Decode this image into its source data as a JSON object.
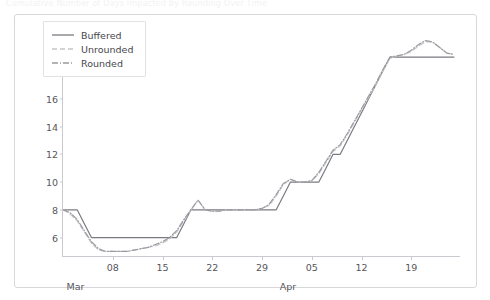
{
  "caption": "Cumulative Number of Days Impacted by Rounding Over Time",
  "legend": {
    "position": "top-left",
    "items": [
      {
        "label": "Buffered",
        "style": "solid",
        "color": "#7a7a80"
      },
      {
        "label": "Unrounded",
        "style": "dashed",
        "color": "#c6c6cb"
      },
      {
        "label": "Rounded",
        "style": "dashdot",
        "color": "#9a9aa0"
      }
    ]
  },
  "chart_data": {
    "type": "line",
    "title": "",
    "xlabel": "",
    "ylabel": "",
    "ylim": [
      4.6,
      20.6
    ],
    "yticks": [
      6,
      8,
      10,
      12,
      14,
      16,
      18,
      20
    ],
    "ytick_labels": [
      "6",
      "8",
      "10",
      "12",
      "14",
      "16",
      "18",
      "20"
    ],
    "xlim": [
      0,
      56
    ],
    "xticks": [
      7,
      14,
      21,
      28,
      35,
      42,
      49
    ],
    "xtick_labels": [
      "08",
      "15",
      "22",
      "29",
      "05",
      "12",
      "19"
    ],
    "xmonth_labels": [
      {
        "label": "Mar",
        "x": 0.5
      },
      {
        "label": "Apr",
        "x": 30.5
      }
    ],
    "grid": false,
    "series": [
      {
        "name": "Buffered",
        "style": "solid",
        "color": "#7a7a80",
        "x": [
          0,
          1,
          2,
          3,
          4,
          5,
          6,
          7,
          8,
          9,
          10,
          11,
          12,
          13,
          14,
          15,
          16,
          17,
          18,
          19,
          20,
          21,
          22,
          23,
          24,
          25,
          26,
          27,
          28,
          29,
          30,
          31,
          32,
          33,
          34,
          35,
          36,
          37,
          38,
          39,
          40,
          41,
          42,
          43,
          44,
          45,
          46,
          47,
          48,
          49,
          50,
          51,
          52,
          53,
          54,
          55
        ],
        "y": [
          8,
          8,
          8,
          7,
          6,
          6,
          6,
          6,
          6,
          6,
          6,
          6,
          6,
          6,
          6,
          6,
          6,
          7,
          8,
          8,
          8,
          8,
          8,
          8,
          8,
          8,
          8,
          8,
          8,
          8,
          8,
          9,
          10,
          10,
          10,
          10,
          10,
          11,
          12,
          12,
          13,
          14,
          15,
          16,
          17,
          18,
          19,
          19,
          19,
          19,
          19,
          19,
          19,
          19,
          19,
          19
        ]
      },
      {
        "name": "Unrounded",
        "style": "dashed",
        "color": "#c6c6cb",
        "x": [
          0,
          1,
          2,
          3,
          4,
          5,
          6,
          7,
          8,
          9,
          10,
          11,
          12,
          13,
          14,
          15,
          16,
          17,
          18,
          19,
          20,
          21,
          22,
          23,
          24,
          25,
          26,
          27,
          28,
          29,
          30,
          31,
          32,
          33,
          34,
          35,
          36,
          37,
          38,
          39,
          40,
          41,
          42,
          43,
          44,
          45,
          46,
          47,
          48,
          49,
          50,
          51,
          52,
          53,
          54,
          55
        ],
        "y": [
          8,
          7.7,
          7.2,
          6.4,
          5.6,
          5.1,
          5.0,
          5.0,
          5.0,
          5.0,
          5.1,
          5.2,
          5.3,
          5.4,
          5.6,
          5.9,
          6.4,
          7.2,
          8.0,
          8.7,
          8.0,
          7.9,
          7.9,
          8.0,
          8.0,
          8.0,
          8.0,
          8.0,
          8.1,
          8.3,
          9.0,
          9.8,
          10.2,
          10.0,
          10.0,
          10.1,
          10.6,
          11.4,
          12.2,
          12.6,
          13.4,
          14.3,
          15.2,
          16.1,
          17.0,
          18.0,
          18.9,
          19.1,
          19.2,
          19.4,
          19.8,
          20.1,
          20.1,
          19.7,
          19.3,
          19.2
        ]
      },
      {
        "name": "Rounded",
        "style": "dashdot",
        "color": "#9a9aa0",
        "x": [
          0,
          1,
          2,
          3,
          4,
          5,
          6,
          7,
          8,
          9,
          10,
          11,
          12,
          13,
          14,
          15,
          16,
          17,
          18,
          19,
          20,
          21,
          22,
          23,
          24,
          25,
          26,
          27,
          28,
          29,
          30,
          31,
          32,
          33,
          34,
          35,
          36,
          37,
          38,
          39,
          40,
          41,
          42,
          43,
          44,
          45,
          46,
          47,
          48,
          49,
          50,
          51,
          52,
          53,
          54,
          55
        ],
        "y": [
          8,
          7.8,
          7.3,
          6.5,
          5.7,
          5.2,
          5.0,
          5.0,
          5.0,
          5.0,
          5.1,
          5.2,
          5.3,
          5.5,
          5.7,
          6.0,
          6.5,
          7.3,
          8.0,
          8.7,
          8.0,
          7.9,
          7.9,
          8.0,
          8.0,
          8.0,
          8.0,
          8.0,
          8.1,
          8.4,
          9.1,
          9.9,
          10.2,
          10.0,
          10.0,
          10.1,
          10.7,
          11.5,
          12.3,
          12.7,
          13.5,
          14.4,
          15.3,
          16.2,
          17.1,
          18.1,
          19.0,
          19.1,
          19.2,
          19.5,
          19.9,
          20.2,
          20.1,
          19.7,
          19.3,
          19.2
        ]
      }
    ]
  }
}
